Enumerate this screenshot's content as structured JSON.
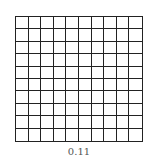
{
  "figure": {
    "rows": 10,
    "cols": 10,
    "shaded_cells": 0,
    "line_color": "#222222",
    "fill_color": "#ffffff",
    "label": "0.11"
  }
}
